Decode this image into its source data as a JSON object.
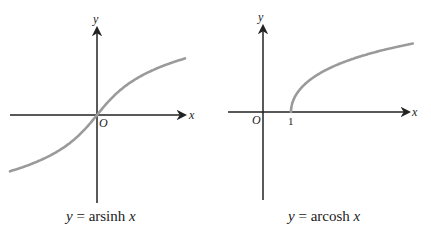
{
  "chart_data": [
    {
      "type": "line",
      "title": "y = arsinh x",
      "function": "arsinh",
      "xlabel": "x",
      "ylabel": "y",
      "origin_label": "O",
      "tick_labels": [],
      "grid": false,
      "legend": null,
      "curve_color": "#9a9a9a",
      "axis_color": "#222222",
      "x": [
        -4,
        -3,
        -2,
        -1,
        0,
        1,
        2,
        3,
        4
      ],
      "values": [
        -2.09,
        -1.82,
        -1.44,
        -0.88,
        0,
        0.88,
        1.44,
        1.82,
        2.09
      ]
    },
    {
      "type": "line",
      "title": "y = arcosh x",
      "function": "arcosh",
      "xlabel": "x",
      "ylabel": "y",
      "origin_label": "O",
      "tick_labels": [
        "1"
      ],
      "grid": false,
      "legend": null,
      "curve_color": "#9a9a9a",
      "axis_color": "#222222",
      "x": [
        1,
        2,
        3,
        4,
        5,
        6,
        7
      ],
      "values": [
        0,
        1.32,
        1.76,
        2.06,
        2.29,
        2.48,
        2.63
      ]
    }
  ],
  "captions": {
    "left": {
      "y": "y",
      "eq": " = arsinh ",
      "x": "x"
    },
    "right": {
      "y": "y",
      "eq": " = arcosh ",
      "x": "x"
    }
  },
  "labels": {
    "left": {
      "x": "x",
      "y": "y",
      "origin": "O"
    },
    "right": {
      "x": "x",
      "y": "y",
      "origin": "O",
      "tick1": "1"
    }
  }
}
